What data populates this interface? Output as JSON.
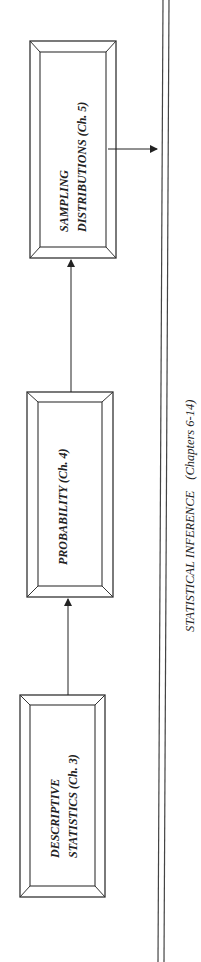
{
  "diagram": {
    "boxes": [
      {
        "id": "descriptive",
        "lines": [
          "DESCRIPTIVE",
          "STATISTICS (Ch. 3)"
        ]
      },
      {
        "id": "probability",
        "lines": [
          "PROBABILITY (Ch. 4)"
        ]
      },
      {
        "id": "sampling",
        "lines": [
          "SAMPLING",
          "DISTRIBUTIONS (Ch. 5)"
        ]
      }
    ],
    "target": {
      "label_main": "STATISTICAL INFERENCE",
      "label_sub": "(Chapters 6-14)"
    },
    "edges": [
      {
        "from": "descriptive",
        "to": "probability"
      },
      {
        "from": "probability",
        "to": "sampling"
      },
      {
        "from": "sampling",
        "to": "inference"
      }
    ],
    "colors": {
      "line": "#333333",
      "bevel": "#555555",
      "background": "#ffffff"
    }
  }
}
